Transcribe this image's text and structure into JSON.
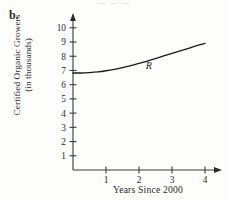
{
  "figure": {
    "part_label": "b.",
    "page_bleed_fragment": "— — —"
  },
  "chart_data": {
    "type": "line",
    "title": "",
    "xlabel": "Years Since 2000",
    "ylabel": "Certified Organic Growers\n(in thousands)",
    "xlim": [
      0,
      4.5
    ],
    "ylim": [
      0,
      10.6
    ],
    "xticks": [
      1,
      2,
      3,
      4
    ],
    "xtick_labels": [
      "1",
      "2",
      "3",
      "4"
    ],
    "yticks": [
      1,
      2,
      3,
      4,
      5,
      6,
      7,
      8,
      9,
      10
    ],
    "ytick_labels": [
      "1",
      "2",
      "3",
      "4",
      "5",
      "6",
      "7",
      "8",
      "9",
      "10"
    ],
    "grid": false,
    "legend": "none",
    "axis_arrows": [
      "x-right",
      "y-up"
    ],
    "series": [
      {
        "name": "R",
        "annotation_label": "R",
        "annotation_x": 2.3,
        "annotation_y": 7.1,
        "x": [
          0,
          0.25,
          0.5,
          0.75,
          1,
          1.25,
          1.5,
          1.75,
          2,
          2.25,
          2.5,
          2.75,
          3,
          3.25,
          3.5,
          3.75,
          4
        ],
        "y": [
          6.82,
          6.82,
          6.85,
          6.9,
          6.98,
          7.08,
          7.2,
          7.34,
          7.5,
          7.66,
          7.84,
          8.02,
          8.2,
          8.38,
          8.56,
          8.74,
          8.9
        ]
      }
    ]
  },
  "colors": {
    "ink": "#2b2b2b",
    "curve": "#1a1a1a",
    "axis": "#3a3a3a",
    "background": "#fdfdfc"
  }
}
